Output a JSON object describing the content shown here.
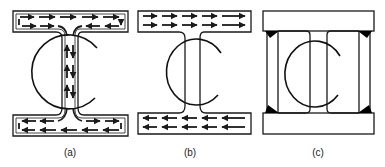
{
  "figure": {
    "panels": [
      {
        "id": "a",
        "label": "(a)",
        "description": "I-beam cross-section with circulating shear flow: flow runs along the top flange, converges into the web, runs down the web and spreads back out along the bottom flange; circular loop threads around the web",
        "flow_arrows": "closed-loop shear flow in flanges and web"
      },
      {
        "id": "b",
        "label": "(b)",
        "description": "I-beam cross-section with uniform flow: top flange arrows point right, bottom flange arrows point left; no flow in web; circular loop around web"
      },
      {
        "id": "c",
        "label": "(c)",
        "description": "Fabricated box section: top and bottom plates joined to two channel-shaped side members with black fillet welds at the four corners; circular loop around central gap"
      }
    ],
    "colors": {
      "line": "#1a1a1a",
      "background": "#ffffff",
      "weld": "#000000"
    }
  }
}
